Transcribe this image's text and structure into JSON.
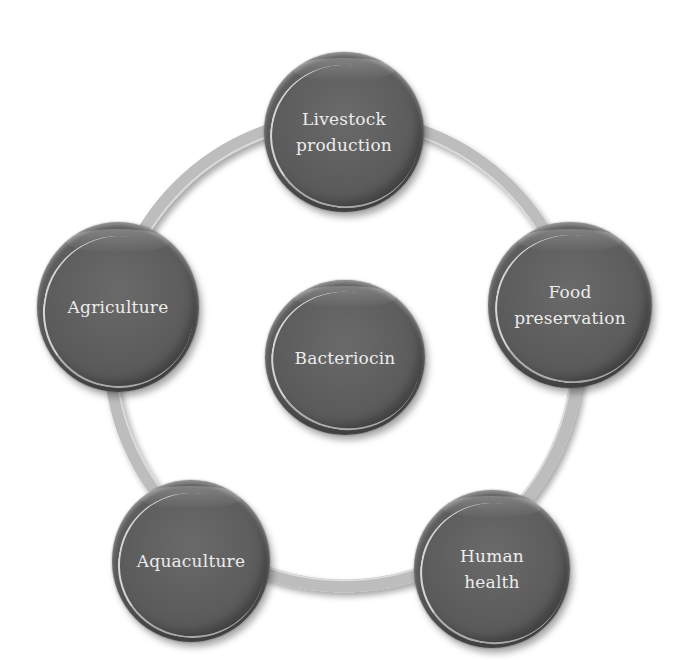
{
  "diagram": {
    "type": "hub-and-ring",
    "center": {
      "label": "Bacteriocin"
    },
    "nodes": [
      {
        "label": "Livestock\nproduction"
      },
      {
        "label": "Food\npreservation"
      },
      {
        "label": "Human\nhealth"
      },
      {
        "label": "Aquaculture"
      },
      {
        "label": "Agriculture"
      }
    ],
    "colors": {
      "node_fill": "#5c5c5c",
      "node_text": "#ececec",
      "ring": "#bdbdbd",
      "background": "#ffffff"
    }
  }
}
